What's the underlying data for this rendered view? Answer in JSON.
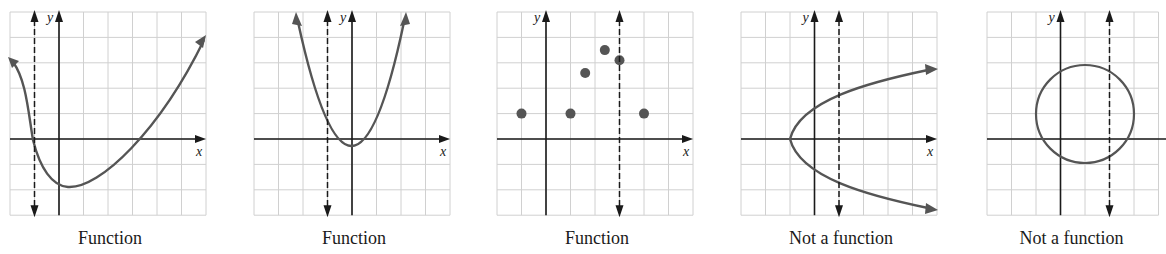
{
  "figure": {
    "panels": [
      {
        "id": "p1",
        "caption": "Function",
        "left": 10,
        "top": 12,
        "cols": 8,
        "rows": 8,
        "y_axis_col": 2,
        "x_axis_row": 5,
        "dashed_col": 1,
        "curve_type": "skewed-curve",
        "x_label": "x",
        "y_label": "y"
      },
      {
        "id": "p2",
        "caption": "Function",
        "left": 254,
        "top": 12,
        "cols": 8,
        "rows": 8,
        "y_axis_col": 4,
        "x_axis_row": 5,
        "dashed_col": 3,
        "curve_type": "parabola-up",
        "x_label": "x",
        "y_label": "y"
      },
      {
        "id": "p3",
        "caption": "Function",
        "left": 497,
        "top": 12,
        "cols": 8,
        "rows": 8,
        "y_axis_col": 2,
        "x_axis_row": 5,
        "dashed_col": 5,
        "curve_type": "scatter-points",
        "points": [
          [
            -1,
            1
          ],
          [
            1,
            1
          ],
          [
            1.6,
            2.6
          ],
          [
            2.4,
            3.5
          ],
          [
            3,
            3.1
          ],
          [
            4,
            1
          ]
        ],
        "x_label": "x",
        "y_label": "y"
      },
      {
        "id": "p4",
        "caption": "Not a function",
        "left": 741,
        "top": 12,
        "cols": 8,
        "rows": 8,
        "y_axis_col": 3,
        "x_axis_row": 5,
        "dashed_col": 4,
        "curve_type": "parabola-right",
        "x_label": "x",
        "y_label": "y"
      },
      {
        "id": "p5",
        "caption": "Not a function",
        "left": 987,
        "top": 12,
        "cols": 7,
        "rows": 8,
        "y_axis_col": 3,
        "x_axis_row": 5,
        "dashed_col": 5,
        "curve_type": "circle",
        "circle": {
          "cx": 1,
          "cy": 1,
          "r": 2
        },
        "x_label": "",
        "y_label": "y"
      }
    ],
    "cell_w": 24.5,
    "cell_h": 25.4,
    "colors": {
      "grid": "#d0d0d0",
      "axis": "#1a1a1a",
      "curve": "#555555",
      "dashed": "#1a1a1a",
      "point": "#555555"
    }
  }
}
